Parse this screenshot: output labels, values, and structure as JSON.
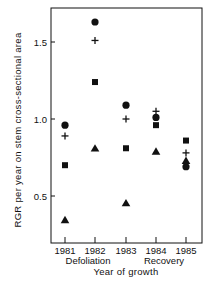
{
  "chart_data": {
    "type": "scatter",
    "title": "",
    "xlabel": "Year of growth",
    "ylabel": "RGR per year on stem cross-sectional area",
    "categories": [
      "1981",
      "1982",
      "1983",
      "1984",
      "1985"
    ],
    "category_annotations": [
      {
        "text": "Defoliation",
        "under": "1981"
      },
      {
        "text": "Recovery",
        "under": "1984"
      }
    ],
    "yticks": [
      0.5,
      1.0,
      1.5
    ],
    "ytick_labels": [
      "0.5",
      "1.0",
      "1.5"
    ],
    "ylim": [
      0.27,
      1.76
    ],
    "grid": false,
    "legend": null,
    "series": [
      {
        "name": "circle",
        "marker": "circle",
        "values": [
          0.96,
          1.63,
          1.09,
          1.01,
          0.69
        ]
      },
      {
        "name": "plus",
        "marker": "plus",
        "values": [
          0.89,
          1.51,
          1.0,
          1.05,
          0.78
        ]
      },
      {
        "name": "square",
        "marker": "square",
        "values": [
          0.7,
          1.24,
          0.81,
          0.96,
          0.86
        ]
      },
      {
        "name": "triangle",
        "marker": "triangle",
        "values": [
          0.345,
          0.81,
          0.455,
          0.79,
          0.73
        ]
      }
    ],
    "colors": {
      "marker": "#111111",
      "axis": "#111111"
    }
  }
}
